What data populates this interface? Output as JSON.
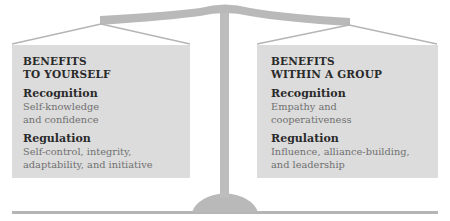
{
  "colors": {
    "scale_gray": "#b9b9b9",
    "pan_fill": "#dcdcdc",
    "heading_text": "#2a2a2a",
    "body_text": "#707070"
  },
  "left_pan": {
    "title_line1": "BENEFITS",
    "title_line2": "TO YOURSELF",
    "sections": [
      {
        "heading": "Recognition",
        "line1": "Self-knowledge",
        "line2": "and confidence"
      },
      {
        "heading": "Regulation",
        "line1": "Self-control, integrity,",
        "line2": "adaptability, and initiative"
      }
    ]
  },
  "right_pan": {
    "title_line1": "BENEFITS",
    "title_line2": "WITHIN A GROUP",
    "sections": [
      {
        "heading": "Recognition",
        "line1": "Empathy and",
        "line2": "cooperativeness"
      },
      {
        "heading": "Regulation",
        "line1": "Influence, alliance-building,",
        "line2": "and leadership"
      }
    ]
  },
  "icons": {
    "scale": "balance-scale-icon"
  }
}
